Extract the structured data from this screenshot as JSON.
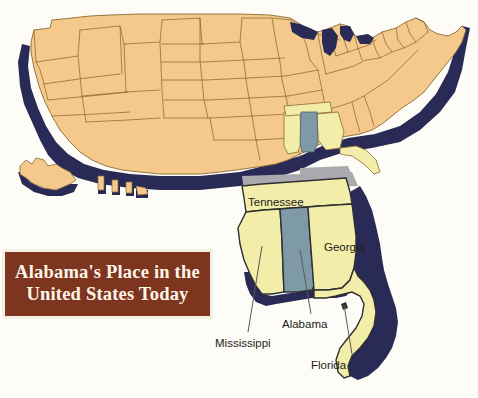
{
  "page": {
    "background_color": "#fdfcf7",
    "width": 478,
    "height": 398
  },
  "title_banner": {
    "name": "title-banner",
    "line1": "Alabama's Place in the",
    "line2": "United States Today",
    "background_color": "#7d3520",
    "text_color": "#fdf6e8",
    "border_color": "#f4efe2"
  },
  "colors": {
    "us_states_fill": "#f5c98c",
    "highlight_region_fill": "#f2eda8",
    "alabama_fill": "#7e9aa6",
    "shadow_navy": "#2a2a56",
    "shadow_gray": "#a9a9ae",
    "outline": "#8a6a32",
    "inset_outline": "#2f2f2f",
    "leader_line": "#5a5a5a"
  },
  "main_map": {
    "name": "united-states-map",
    "description": "United States map with 3D navy drop shadow",
    "alaska": "Alaska",
    "hawaii": "Hawaii",
    "great_lakes": "Great Lakes"
  },
  "inset_map": {
    "name": "southeast-inset-map",
    "description": "Enlarged southeastern states with Alabama highlighted",
    "labels": [
      {
        "name": "inset-label-tennessee",
        "text": "Tennessee",
        "x": 248,
        "y": 196,
        "leader": false
      },
      {
        "name": "inset-label-georgia",
        "text": "Georgia",
        "x": 324,
        "y": 241,
        "leader": false
      },
      {
        "name": "inset-label-alabama",
        "text": "Alabama",
        "x": 282,
        "y": 318,
        "leader": true
      },
      {
        "name": "inset-label-mississippi",
        "text": "Mississippi",
        "x": 215,
        "y": 337,
        "leader": true
      },
      {
        "name": "inset-label-florida",
        "text": "Florida",
        "x": 311,
        "y": 359,
        "leader": true
      }
    ]
  },
  "ghost_text": {
    "note": "faint show-through text from reverse of printed page",
    "lines": [
      {
        "text": "the eastern third of",
        "x": 120,
        "y": 40
      },
      {
        "text": "through the nation of Georgia",
        "x": 110,
        "y": 62
      },
      {
        "text": "southern end of the Appalachian",
        "x": 100,
        "y": 85
      },
      {
        "text": "the nation",
        "x": 115,
        "y": 108
      }
    ]
  }
}
